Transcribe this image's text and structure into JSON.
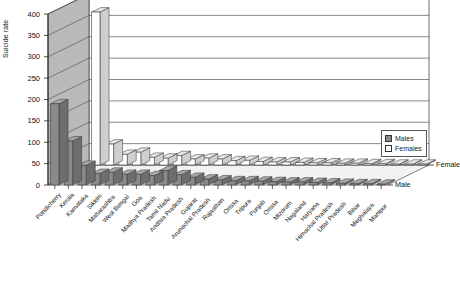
{
  "chart_data": {
    "type": "bar",
    "title": "",
    "subtitle": "",
    "xlabel": "",
    "ylabel": "Suicide rate",
    "ylim": [
      0,
      400
    ],
    "yticks": [
      0,
      50,
      100,
      150,
      200,
      250,
      300,
      350,
      400
    ],
    "grid": true,
    "orientation": "vertical-3d",
    "legend_position": "right",
    "depth_axis_labels": [
      "Female",
      "Male"
    ],
    "categories": [
      "Pondicherry",
      "Kerala",
      "Karnataka",
      "Sikkim",
      "Maharashtra",
      "West Bengal",
      "Goa",
      "Madhya Pradesh",
      "Tamil Nadu",
      "Andhra Pradesh",
      "Gujarat",
      "Arunachal Pradesh",
      "Rajasthan",
      "Orissa",
      "Tripura",
      "Punjab",
      "Orissa",
      "Mizoram",
      "Nagaland",
      "Haryana",
      "Himachal Pradesh",
      "Uttar Pradesh",
      "Bihar",
      "Meghalaya",
      "Manipur"
    ],
    "series": [
      {
        "name": "Males",
        "color": "#8a8a8a",
        "values": [
          190,
          103,
          46,
          27,
          30,
          25,
          25,
          22,
          34,
          24,
          18,
          14,
          12,
          10,
          10,
          9,
          8,
          7,
          7,
          6,
          5,
          4,
          3,
          3,
          2
        ]
      },
      {
        "name": "Females",
        "color": "#ffffff",
        "values": [
          400,
          49,
          25,
          30,
          18,
          16,
          22,
          14,
          16,
          14,
          10,
          11,
          8,
          7,
          7,
          6,
          5,
          5,
          4,
          4,
          3,
          3,
          2,
          2,
          2
        ]
      }
    ]
  },
  "legend": {
    "items": [
      {
        "label": "Males",
        "swatch": "males-swatch"
      },
      {
        "label": "Females",
        "swatch": "females-swatch"
      }
    ]
  }
}
